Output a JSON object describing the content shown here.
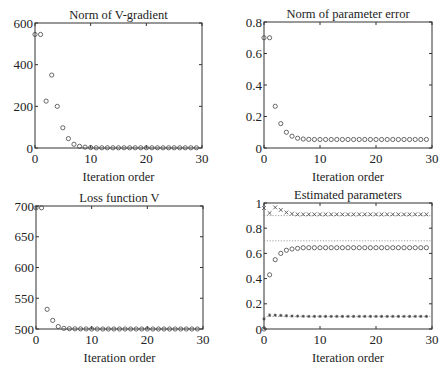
{
  "figure": {
    "width": 448,
    "height": 370
  },
  "chart_data": [
    {
      "id": "norm-v-gradient",
      "type": "scatter",
      "title": "Norm of V-gradient",
      "xlabel": "Iteration order",
      "ylabel": "",
      "xlim": [
        0,
        30
      ],
      "ylim": [
        0,
        600
      ],
      "xticks": [
        0,
        10,
        20,
        30
      ],
      "yticks": [
        0,
        200,
        400,
        600
      ],
      "ytick_labels": [
        "0",
        "200",
        "400",
        "600"
      ],
      "grid": false,
      "box": {
        "left": 35,
        "top": 23,
        "right": 202,
        "bottom": 148
      },
      "series": [
        {
          "name": "gradient norm",
          "marker": "o",
          "x": [
            0,
            1,
            2,
            3,
            4,
            5,
            6,
            7,
            8,
            9,
            10,
            11,
            12,
            13,
            14,
            15,
            16,
            17,
            18,
            19,
            20,
            21,
            22,
            23,
            24,
            25,
            26,
            27,
            28,
            29
          ],
          "y": [
            545,
            545,
            225,
            350,
            200,
            97,
            45,
            18,
            8,
            4,
            2,
            1,
            1,
            1,
            1,
            1,
            1,
            1,
            1,
            1,
            1,
            1,
            1,
            1,
            1,
            1,
            1,
            1,
            1,
            1
          ]
        }
      ],
      "reference_lines": []
    },
    {
      "id": "norm-parameter-error",
      "type": "scatter",
      "title": "Norm of parameter error",
      "xlabel": "Iteration order",
      "ylabel": "",
      "xlim": [
        0,
        30
      ],
      "ylim": [
        0,
        0.8
      ],
      "xticks": [
        0,
        10,
        20,
        30
      ],
      "yticks": [
        0,
        0.2,
        0.4,
        0.6,
        0.8
      ],
      "ytick_labels": [
        "0",
        "0.2",
        "0.4",
        "0.6",
        "0.8"
      ],
      "grid": false,
      "box": {
        "left": 264,
        "top": 22,
        "right": 432,
        "bottom": 148
      },
      "series": [
        {
          "name": "parameter error norm",
          "marker": "o",
          "x": [
            0,
            1,
            2,
            3,
            4,
            5,
            6,
            7,
            8,
            9,
            10,
            11,
            12,
            13,
            14,
            15,
            16,
            17,
            18,
            19,
            20,
            21,
            22,
            23,
            24,
            25,
            26,
            27,
            28,
            29
          ],
          "y": [
            0.7,
            0.7,
            0.265,
            0.155,
            0.1,
            0.075,
            0.062,
            0.057,
            0.055,
            0.054,
            0.054,
            0.054,
            0.054,
            0.054,
            0.054,
            0.054,
            0.054,
            0.054,
            0.054,
            0.054,
            0.054,
            0.054,
            0.054,
            0.054,
            0.054,
            0.054,
            0.054,
            0.054,
            0.054,
            0.054
          ]
        }
      ],
      "reference_lines": []
    },
    {
      "id": "loss-function-v",
      "type": "scatter",
      "title": "Loss function V",
      "xlabel": "Iteration order",
      "ylabel": "",
      "xlim": [
        0,
        30
      ],
      "ylim": [
        500,
        700
      ],
      "xticks": [
        0,
        10,
        20,
        30
      ],
      "yticks": [
        500,
        550,
        600,
        650,
        700
      ],
      "ytick_labels": [
        "500",
        "550",
        "600",
        "650",
        "700"
      ],
      "grid": false,
      "box": {
        "left": 36,
        "top": 206,
        "right": 203,
        "bottom": 329
      },
      "series": [
        {
          "name": "loss V",
          "marker": "o",
          "x": [
            0,
            1,
            2,
            3,
            4,
            5,
            6,
            7,
            8,
            9,
            10,
            11,
            12,
            13,
            14,
            15,
            16,
            17,
            18,
            19,
            20,
            21,
            22,
            23,
            24,
            25,
            26,
            27,
            28,
            29
          ],
          "y": [
            697,
            697,
            532,
            514,
            504,
            501,
            500.5,
            500.3,
            500.2,
            500.1,
            500,
            500,
            500,
            500,
            500,
            500,
            500,
            500,
            500,
            500,
            500,
            500,
            500,
            500,
            500,
            500,
            500,
            500,
            500,
            500
          ]
        }
      ],
      "reference_lines": []
    },
    {
      "id": "estimated-parameters",
      "type": "scatter",
      "title": "Estimated parameters",
      "xlabel": "Iteration order",
      "ylabel": "",
      "xlim": [
        0,
        30
      ],
      "ylim": [
        0,
        1
      ],
      "xticks": [
        0,
        10,
        20,
        30
      ],
      "yticks": [
        0,
        0.2,
        0.4,
        0.6,
        0.8,
        1
      ],
      "ytick_labels": [
        "0",
        "0.2",
        "0.4",
        "0.6",
        "0.8",
        "1"
      ],
      "grid": false,
      "box": {
        "left": 264,
        "top": 203,
        "right": 432,
        "bottom": 329
      },
      "series": [
        {
          "name": "parameter 1",
          "marker": "x",
          "x": [
            0,
            1,
            2,
            3,
            4,
            5,
            6,
            7,
            8,
            9,
            10,
            11,
            12,
            13,
            14,
            15,
            16,
            17,
            18,
            19,
            20,
            21,
            22,
            23,
            24,
            25,
            26,
            27,
            28,
            29
          ],
          "y": [
            0.96,
            0.92,
            0.965,
            0.945,
            0.925,
            0.915,
            0.91,
            0.91,
            0.91,
            0.91,
            0.91,
            0.91,
            0.91,
            0.91,
            0.91,
            0.91,
            0.91,
            0.91,
            0.91,
            0.91,
            0.91,
            0.91,
            0.91,
            0.91,
            0.91,
            0.91,
            0.91,
            0.91,
            0.91,
            0.91
          ]
        },
        {
          "name": "parameter 2",
          "marker": "o",
          "x": [
            0,
            1,
            2,
            3,
            4,
            5,
            6,
            7,
            8,
            9,
            10,
            11,
            12,
            13,
            14,
            15,
            16,
            17,
            18,
            19,
            20,
            21,
            22,
            23,
            24,
            25,
            26,
            27,
            28,
            29
          ],
          "y": [
            0.0,
            0.43,
            0.55,
            0.6,
            0.625,
            0.635,
            0.64,
            0.645,
            0.645,
            0.645,
            0.645,
            0.645,
            0.645,
            0.645,
            0.645,
            0.645,
            0.645,
            0.645,
            0.645,
            0.645,
            0.645,
            0.645,
            0.645,
            0.645,
            0.645,
            0.645,
            0.645,
            0.645,
            0.645,
            0.645
          ]
        },
        {
          "name": "parameter 3",
          "marker": "*",
          "x": [
            0,
            1,
            2,
            3,
            4,
            5,
            6,
            7,
            8,
            9,
            10,
            11,
            12,
            13,
            14,
            15,
            16,
            17,
            18,
            19,
            20,
            21,
            22,
            23,
            24,
            25,
            26,
            27,
            28,
            29
          ],
          "y": [
            0.08,
            0.11,
            0.11,
            0.108,
            0.105,
            0.103,
            0.102,
            0.101,
            0.1,
            0.1,
            0.1,
            0.1,
            0.1,
            0.1,
            0.1,
            0.1,
            0.1,
            0.1,
            0.1,
            0.1,
            0.1,
            0.1,
            0.1,
            0.1,
            0.1,
            0.1,
            0.1,
            0.1,
            0.1,
            0.1
          ]
        }
      ],
      "reference_lines": [
        {
          "name": "true parameter 1",
          "y": 0.9,
          "style": "dotted"
        },
        {
          "name": "true parameter 2",
          "y": 0.7,
          "style": "dotted"
        },
        {
          "name": "true parameter 3",
          "y": 0.1,
          "style": "dotted"
        }
      ]
    }
  ],
  "colors": {
    "axis": "#333333",
    "marker": "#444444",
    "reference_line": "#888888",
    "background": "#ffffff"
  }
}
